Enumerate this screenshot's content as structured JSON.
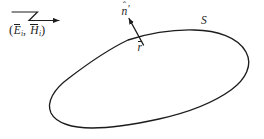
{
  "figure": {
    "kind": "geometry-diagram",
    "width": 264,
    "height": 139,
    "background_color": "#ffffff",
    "stroke_color": "#1c1c1c"
  },
  "labels": {
    "incident_field": {
      "open_paren": "(",
      "e_symbol": "E",
      "e_subscript": "i",
      "comma": ", ",
      "h_symbol": "H",
      "h_subscript": "i",
      "close_paren": ")",
      "plain_text": "(Ēᵢ, H̄ᵢ)"
    },
    "normal_vector": {
      "symbol": "n",
      "hat": "ˆ",
      "prime": "′",
      "plain_text": "n̂′"
    },
    "position_vector": {
      "symbol": "r",
      "plain_text": "r̄"
    },
    "surface": {
      "symbol": "S",
      "plain_text": "S"
    }
  },
  "graphics": {
    "surface_outline": {
      "name": "closed-surface-blob",
      "path": "M 128 40 C 156 32 186 29 208 32 C 232 35 248 48 247 65 C 246 82 232 95 212 105 C 190 116 160 124 132 127 C 110 129 90 130 74 126 C 56 121 48 111 50 100 C 52 88 64 76 82 66 C 97 57 112 47 128 40 Z"
    },
    "normal_arrow": {
      "name": "normal-vector-arrow",
      "tail": [
        143,
        45
      ],
      "tip": [
        128,
        17
      ],
      "head_style": "solid-triangle"
    },
    "incident_ray": {
      "name": "incident-wave-ray",
      "segments": [
        [
          12,
          12,
          37,
          12
        ],
        [
          37,
          12,
          29,
          20
        ],
        [
          29,
          20,
          60,
          20
        ]
      ],
      "tip": [
        66,
        20
      ],
      "head_style": "solid-triangle"
    }
  }
}
